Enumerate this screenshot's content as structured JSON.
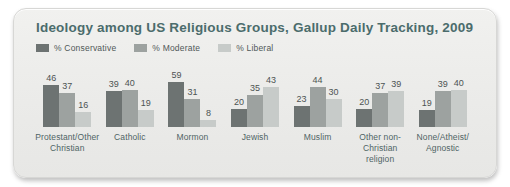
{
  "card": {
    "title": "Ideology among US Religious Groups, Gallup Daily Tracking, 2009"
  },
  "colors": {
    "card_background": "#ebebe9",
    "title_text": "#4b6c6c",
    "conservative": "#6d7372",
    "moderate": "#9da2a0",
    "liberal": "#c7cbc9"
  },
  "chart_data": {
    "type": "bar",
    "title": "Ideology among US Religious Groups, Gallup Daily Tracking, 2009",
    "legend_position": "top-left",
    "grid": false,
    "ylim": [
      0,
      62
    ],
    "categories": [
      "Protestant/Other\nChristian",
      "Catholic",
      "Mormon",
      "Jewish",
      "Muslim",
      "Other non-\nChristian religion",
      "None/Atheist/\nAgnostic"
    ],
    "series": [
      {
        "name": "% Conservative",
        "color": "#6d7372",
        "values": [
          46,
          39,
          59,
          20,
          23,
          20,
          19
        ]
      },
      {
        "name": "% Moderate",
        "color": "#9da2a0",
        "values": [
          37,
          40,
          31,
          35,
          44,
          37,
          39
        ]
      },
      {
        "name": "% Liberal",
        "color": "#c7cbc9",
        "values": [
          16,
          19,
          8,
          43,
          30,
          39,
          40
        ]
      }
    ]
  }
}
